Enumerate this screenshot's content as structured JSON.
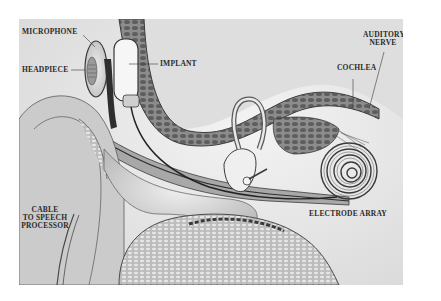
{
  "diagram": {
    "labels": {
      "microphone": "MICROPHONE",
      "headpiece": "HEADPIECE",
      "implant": "IMPLANT",
      "cochlea": "COCHLEA",
      "auditory_nerve_line1": "AUDITORY",
      "auditory_nerve_line2": "NERVE",
      "electrode_array": "ELECTRODE ARRAY",
      "cable_line1": "CABLE",
      "cable_line2": "TO SPEECH",
      "cable_line3": "PROCESSOR"
    },
    "colors": {
      "background": "#e9e9e9",
      "bone": "#8a8a8a",
      "dark": "#3a3a3a",
      "light": "#f2f2f2"
    }
  }
}
